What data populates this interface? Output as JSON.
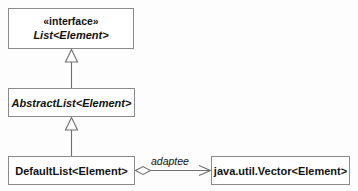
{
  "diagram": {
    "type": "uml-class-diagram",
    "background_color": "#fdfdfd",
    "box_fill": "#ffffff",
    "border_color": "#8a8a8a",
    "line_color": "#6e6e6e",
    "text_color": "#111111",
    "classes": [
      {
        "id": "list",
        "stereotype": "«interface»",
        "name": "List<Element>",
        "style": "italic"
      },
      {
        "id": "abstractlist",
        "name": "AbstractList<Element>",
        "style": "italic"
      },
      {
        "id": "defaultlist",
        "name": "DefaultList<Element>",
        "style": "plain"
      },
      {
        "id": "vector",
        "name": "java.util.Vector<Element>",
        "style": "plain"
      }
    ],
    "relationships": [
      {
        "id": "gen-abstract-list",
        "kind": "generalization",
        "from": "abstractlist",
        "to": "list",
        "arrowhead": "hollow-triangle"
      },
      {
        "id": "gen-default-abstract",
        "kind": "generalization",
        "from": "defaultlist",
        "to": "abstractlist",
        "arrowhead": "hollow-triangle"
      },
      {
        "id": "agg-default-vector",
        "kind": "aggregation",
        "from": "defaultlist",
        "to": "vector",
        "label": "adaptee",
        "source_decoration": "hollow-diamond",
        "arrowhead": "open-arrow"
      }
    ]
  }
}
